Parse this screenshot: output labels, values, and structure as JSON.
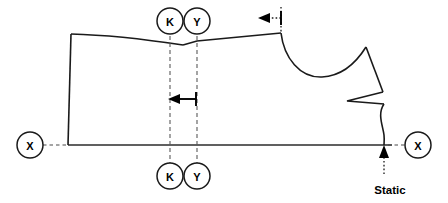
{
  "diagram": {
    "type": "sewing-pattern-schematic",
    "background_color": "#ffffff",
    "line_color": "#1a1a1a",
    "guide_color": "#5a5a5a"
  },
  "markers": {
    "top_k": {
      "label": "K",
      "cx": 170,
      "cy": 21,
      "r": 13
    },
    "top_y": {
      "label": "Y",
      "cx": 197,
      "cy": 21,
      "r": 13
    },
    "bottom_k": {
      "label": "K",
      "cx": 170,
      "cy": 176,
      "r": 13
    },
    "bottom_y": {
      "label": "Y",
      "cx": 197,
      "cy": 176,
      "r": 13
    },
    "left_x": {
      "label": "X",
      "cx": 30,
      "cy": 145,
      "r": 13
    },
    "right_x": {
      "label": "X",
      "cx": 418,
      "cy": 145,
      "r": 13
    }
  },
  "annotations": {
    "static_label": "Static",
    "static_label_x": 390,
    "static_label_y": 190,
    "neck_arrow_label": "",
    "width_arrow_label": ""
  },
  "guides": {
    "k_line_x": 170,
    "y_line_x": 197,
    "k_line_top": 36,
    "k_line_bottom": 163,
    "baseline_y": 145,
    "baseline_start_x": 68,
    "baseline_end_x": 392
  },
  "colors": {
    "outline": "#1a1a1a",
    "baseline": "#2b2b2b",
    "guide": "#5a5a5a",
    "text": "#000000",
    "background": "#ffffff"
  }
}
